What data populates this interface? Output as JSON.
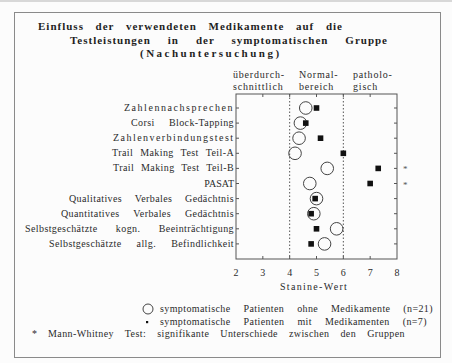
{
  "title": {
    "line1": "Einfluss der verwendeten Medikamente auf die",
    "line2": "Testleistungen in der symptomatischen Gruppe",
    "line3": "(Nachuntersuchung)"
  },
  "range_headers": [
    {
      "line1": "überdurch-",
      "line2": "schnittlich"
    },
    {
      "line1": "Normal-",
      "line2": "bereich"
    },
    {
      "line1": "patholo-",
      "line2": "gisch"
    }
  ],
  "legend": {
    "without_medication": "symptomatische Patienten ohne Medikamente (n=21)",
    "with_medication": "symptomatische Patienten mit Medikamenten (n=7)",
    "footnote_marker": "*",
    "footnote": "Mann-Whitney Test: signifikante Unterschiede zwischen den Gruppen"
  },
  "colors": {
    "text": "#2b2b2b",
    "frame": "#8a8a8a",
    "marker": "#111111"
  },
  "chart_data": {
    "type": "scatter",
    "xlabel": "Stanine-Wert",
    "ylabel": "",
    "xlim": [
      2,
      8
    ],
    "xticks": [
      2,
      3,
      4,
      5,
      6,
      7,
      8
    ],
    "grid": false,
    "legend_position": "bottom",
    "reference_lines": [
      4,
      6
    ],
    "regions": [
      {
        "label": "überdurchschnittlich",
        "range": [
          2,
          4
        ]
      },
      {
        "label": "Normalbereich",
        "range": [
          4,
          6
        ]
      },
      {
        "label": "pathologisch",
        "range": [
          6,
          8
        ]
      }
    ],
    "categories": [
      "Zahlennachsprechen",
      "Corsi Block-Tapping",
      "Zahlenverbindungstest",
      "Trail Making Test Teil-A",
      "Trail Making Test Teil-B",
      "PASAT",
      "Qualitatives Verbales Gedächtnis",
      "Quantitatives Verbales Gedächtnis",
      "Selbstgeschätzte kogn. Beeinträchtigung",
      "Selbstgeschätzte allg. Befindlichkeit"
    ],
    "series": [
      {
        "name": "symptomatische Patienten ohne Medikamente (n=21)",
        "marker": "open-circle",
        "values": [
          4.6,
          4.4,
          4.35,
          4.2,
          5.4,
          4.75,
          5.0,
          4.9,
          5.75,
          5.3
        ]
      },
      {
        "name": "symptomatische Patienten mit Medikamenten (n=7)",
        "marker": "filled-square",
        "values": [
          5.0,
          4.6,
          5.15,
          6.0,
          7.3,
          7.0,
          4.95,
          4.8,
          5.0,
          4.8
        ]
      }
    ],
    "significant": [
      false,
      false,
      false,
      false,
      true,
      true,
      false,
      false,
      false,
      false
    ],
    "significance_marker": "*"
  }
}
